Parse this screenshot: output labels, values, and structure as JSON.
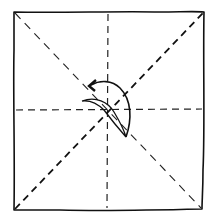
{
  "diagram": {
    "type": "origami-fold-diagram",
    "background": "#ffffff",
    "ink": "#111111",
    "paper": {
      "corners": {
        "top_left": [
          14,
          12
        ],
        "top_right": [
          204,
          12
        ],
        "bottom_right": [
          202,
          209
        ],
        "bottom_left": [
          14,
          210
        ]
      }
    },
    "crease_lines": [
      {
        "name": "vertical-center-crease",
        "style": "dashed",
        "from": [
          108,
          12
        ],
        "to": [
          108,
          210
        ]
      },
      {
        "name": "horizontal-center-crease",
        "style": "dashed",
        "from": [
          14,
          110
        ],
        "to": [
          204,
          110
        ]
      },
      {
        "name": "diagonal-tl-br-crease",
        "style": "dashed-thin",
        "from": [
          14,
          12
        ],
        "to": [
          202,
          209
        ]
      },
      {
        "name": "diagonal-bl-tr-crease",
        "style": "dashed-bold",
        "from": [
          14,
          210
        ],
        "to": [
          204,
          12
        ]
      }
    ],
    "symbols": [
      {
        "name": "fold-arrow",
        "description": "curved arrow from center sweeping right then up and back to upper-left, indicating fold of corner to center"
      },
      {
        "name": "fold-flap",
        "description": "small crescent-shaped flap near center"
      }
    ]
  }
}
